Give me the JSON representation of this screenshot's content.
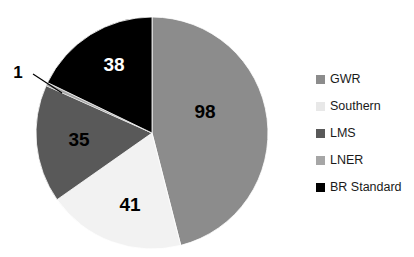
{
  "chart_data": {
    "type": "pie",
    "title": "",
    "categories": [
      "GWR",
      "Southern",
      "LMS",
      "LNER",
      "BR Standard"
    ],
    "values": [
      98,
      41,
      35,
      1,
      38
    ],
    "total": 213,
    "data_labels": [
      "98",
      "41",
      "35",
      "1",
      "38"
    ],
    "colors": [
      "#8c8c8c",
      "#f2f2f2",
      "#595959",
      "#a6a6a6",
      "#000000"
    ],
    "label_colors": [
      "#000000",
      "#000000",
      "#000000",
      "#000000",
      "#ffffff"
    ],
    "start_angle_deg": 0,
    "direction": "clockwise",
    "legend_position": "right",
    "grid": false,
    "xlabel": "",
    "ylabel": "",
    "callouts": [
      {
        "label": "1",
        "series": "LNER",
        "leader": true
      }
    ]
  },
  "pie": {
    "center_x": 152,
    "center_y": 133,
    "radius": 116,
    "slices": [
      {
        "name": "GWR",
        "value": 98,
        "label": "98",
        "color": "#8c8c8c",
        "label_color": "#000000",
        "label_x": 205,
        "label_y": 118
      },
      {
        "name": "Southern",
        "value": 41,
        "label": "41",
        "color": "#f2f2f2",
        "label_color": "#000000",
        "label_x": 130,
        "label_y": 211
      },
      {
        "name": "LMS",
        "value": 35,
        "label": "35",
        "color": "#595959",
        "label_color": "#000000",
        "label_x": 79,
        "label_y": 146
      },
      {
        "name": "LNER",
        "value": 1,
        "label": "1",
        "color": "#a6a6a6",
        "label_color": "#000000",
        "label_x": 18,
        "label_y": 78
      },
      {
        "name": "BR Standard",
        "value": 38,
        "label": "38",
        "color": "#000000",
        "label_color": "#ffffff",
        "label_x": 114,
        "label_y": 71
      }
    ],
    "leader_line": {
      "x1": 33,
      "y1": 74,
      "x2": 62,
      "y2": 93,
      "color": "#000000"
    }
  },
  "legend": {
    "items": [
      {
        "label": "GWR",
        "color": "#8c8c8c"
      },
      {
        "label": "Southern",
        "color": "#e8e8e8"
      },
      {
        "label": "LMS",
        "color": "#595959"
      },
      {
        "label": "LNER",
        "color": "#a6a6a6"
      },
      {
        "label": "BR Standard",
        "color": "#000000"
      }
    ]
  }
}
